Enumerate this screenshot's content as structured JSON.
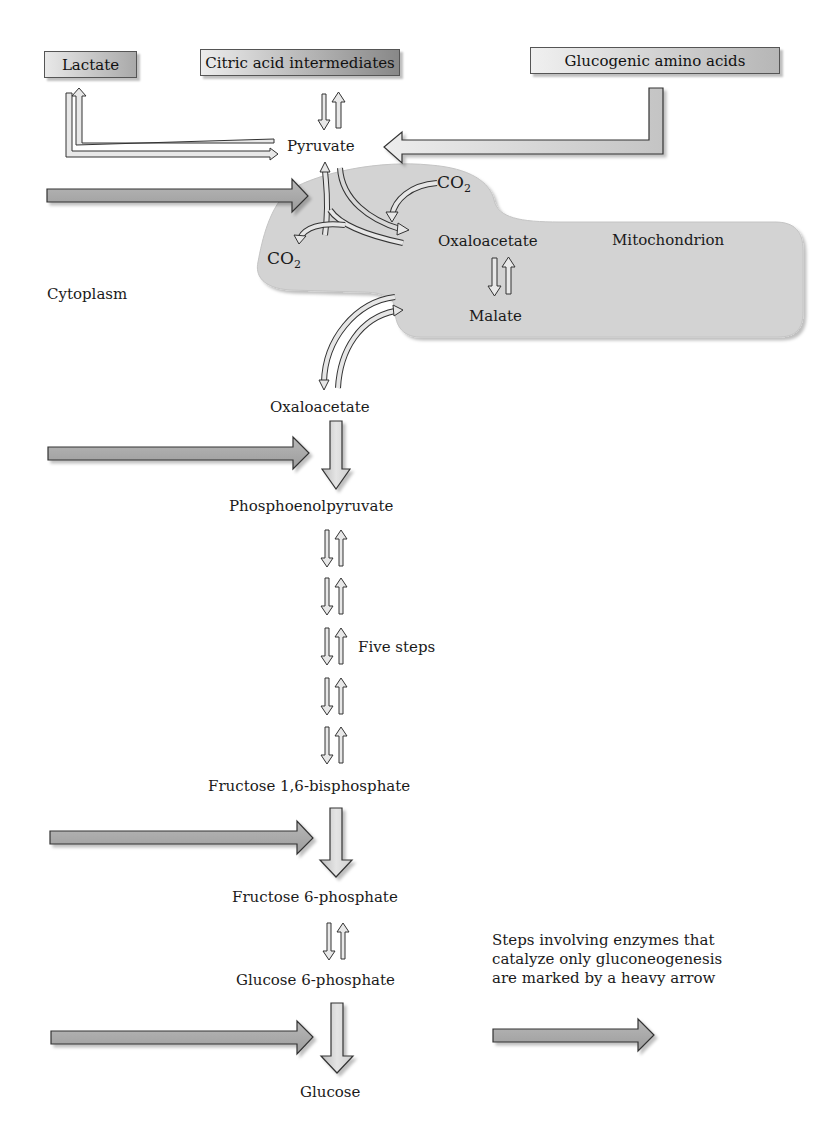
{
  "colors": {
    "mitochondrion_fill": "#d2d2d2",
    "heavy_arrow_fill": "#a8a8a8",
    "thin_arrow_fill": "#e6e6e6",
    "outline": "#333333",
    "text": "#1a1a1a"
  },
  "sources": {
    "lactate": "Lactate",
    "citric_acid": "Citric acid intermediates",
    "glucogenic_amino_acids": "Glucogenic amino acids"
  },
  "compartments": {
    "mitochondrion": "Mitochondrion",
    "cytoplasm": "Cytoplasm"
  },
  "metabolites": {
    "pyruvate": "Pyruvate",
    "co2_top": "CO",
    "co2_top_sub": "2",
    "co2_left": "CO",
    "co2_left_sub": "2",
    "oxaloacetate_mito": "Oxaloacetate",
    "malate": "Malate",
    "oxaloacetate_cyto": "Oxaloacetate",
    "phosphoenolpyruvate": "Phosphoenolpyruvate",
    "five_steps": "Five steps",
    "fructose_bisphosphate": "Fructose 1,6-bisphosphate",
    "fructose_6_phosphate": "Fructose 6-phosphate",
    "glucose_6_phosphate": "Glucose 6-phosphate",
    "glucose": "Glucose"
  },
  "legend": {
    "line1": "Steps involving enzymes that",
    "line2": "catalyze only gluconeogenesis",
    "line3": "are marked by a heavy arrow"
  }
}
